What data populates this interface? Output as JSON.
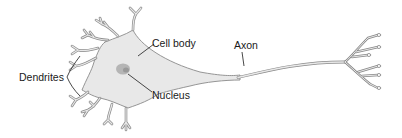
{
  "diagram": {
    "labels": {
      "dendrites": "Dendrites",
      "cell_body": "Cell body",
      "nucleus": "Nucleus",
      "axon": "Axon"
    },
    "colors": {
      "cell_fill": "#e8e8e8",
      "outline": "#8a8a8a",
      "nucleus": "#b5b5b5",
      "text": "#1a1a1a"
    }
  }
}
